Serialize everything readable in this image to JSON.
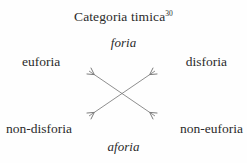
{
  "diagram": {
    "type": "semiotic-square",
    "title": "Categoria timica",
    "title_superscript": "30",
    "background_color": "#fefefe",
    "text_color": "#2b2b2b",
    "arrow_color": "#7a7a7a",
    "terms": {
      "top": "foria",
      "bottom": "aforia",
      "top_left": "euforia",
      "top_right": "disforia",
      "bottom_left": "non-disforia",
      "bottom_right": "non-euforia"
    },
    "relations": [
      {
        "name": "euforia-non-euforia",
        "from": "euforia",
        "to": "non-euforia",
        "style": "double-headed-diagonal-arrow"
      },
      {
        "name": "disforia-non-disforia",
        "from": "disforia",
        "to": "non-disforia",
        "style": "double-headed-diagonal-arrow"
      }
    ]
  }
}
